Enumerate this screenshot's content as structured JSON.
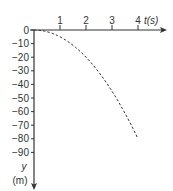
{
  "chart_data": {
    "type": "line",
    "title": "",
    "xlabel": "t(s)",
    "ylabel": "y (m)",
    "x_label_var": "t",
    "x_label_unit": "(s)",
    "y_label_var": "y",
    "y_label_unit": "(m)",
    "xlim": [
      0,
      4.9
    ],
    "ylim": [
      -100,
      0
    ],
    "grid": false,
    "legend": null,
    "x_ticks": [
      "1",
      "2",
      "3",
      "4"
    ],
    "y_ticks": [
      "0",
      "−10",
      "−20",
      "−30",
      "−40",
      "−50",
      "−60",
      "−70",
      "−80",
      "−90"
    ],
    "series": [
      {
        "name": "y(t)",
        "style": "dashed",
        "color": "#333333",
        "x": [
          0,
          0.5,
          1,
          1.5,
          2,
          2.5,
          3,
          3.5,
          4
        ],
        "values": [
          0,
          -1.25,
          -5,
          -11.25,
          -20,
          -31.25,
          -45,
          -61.25,
          -80
        ]
      }
    ]
  },
  "colors": {
    "axis": "#333333",
    "curve": "#333333",
    "background": "#ffffff"
  }
}
